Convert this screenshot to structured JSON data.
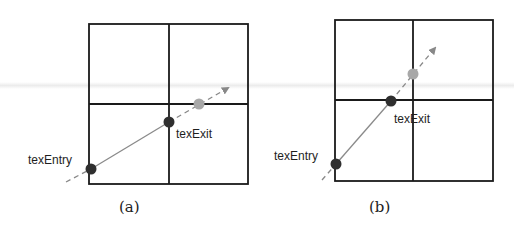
{
  "figure": {
    "panels": [
      {
        "id": "a",
        "caption": "(a)",
        "grid": {
          "left": 89,
          "top": 24,
          "right": 248,
          "bottom": 184,
          "mid_x": 169,
          "mid_y": 104
        },
        "ray": {
          "start": [
            66,
            182
          ],
          "tip": [
            228,
            88
          ]
        },
        "entry": {
          "label": "texEntry",
          "x": 91,
          "y": 169
        },
        "exit": {
          "label": "texExit",
          "x": 169,
          "y": 122
        },
        "next_point": {
          "x": 199,
          "y": 104
        }
      },
      {
        "id": "b",
        "caption": "(b)",
        "grid": {
          "left": 335,
          "top": 20,
          "right": 493,
          "bottom": 181,
          "mid_x": 413,
          "mid_y": 100
        },
        "ray": {
          "start": [
            322,
            180
          ],
          "tip": [
            435,
            48
          ]
        },
        "entry": {
          "label": "texEntry",
          "x": 336,
          "y": 164
        },
        "exit": {
          "label": "texExit",
          "x": 391,
          "y": 101
        },
        "next_point": {
          "x": 413,
          "y": 74
        }
      }
    ],
    "colors": {
      "grid": "#1a1a1a",
      "solid_segment": "#8a8a8a",
      "dashed_ray": "#888888",
      "entry_exit_point": "#2f2f2f",
      "next_point": "#a8a8a8"
    }
  }
}
